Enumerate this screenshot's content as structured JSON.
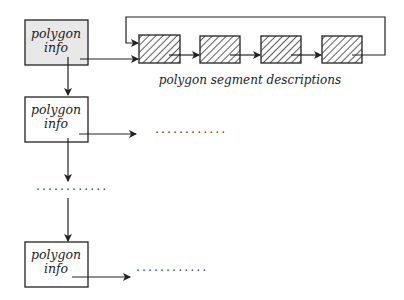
{
  "diagram": {
    "polygon_nodes": [
      {
        "line1": "polygon",
        "line2": "info",
        "filled": true
      },
      {
        "line1": "polygon",
        "line2": "info",
        "filled": false
      },
      {
        "line1": "polygon",
        "line2": "info",
        "filled": false
      }
    ],
    "segment_caption": "polygon segment descriptions",
    "segment_count": 4,
    "ellipsis": "............",
    "colors": {
      "stroke": "#222222",
      "node_fill_first": "#e8e8e8",
      "node_fill": "#ffffff"
    }
  }
}
